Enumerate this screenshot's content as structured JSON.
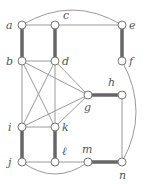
{
  "diagram": {
    "type": "graph",
    "nodes": [
      {
        "id": "a",
        "label": "a",
        "x": 22,
        "y": 25,
        "lx": 6,
        "ly": 29
      },
      {
        "id": "c",
        "label": "c",
        "x": 55,
        "y": 25,
        "lx": 63,
        "ly": 19
      },
      {
        "id": "e",
        "label": "e",
        "x": 122,
        "y": 25,
        "lx": 129,
        "ly": 29
      },
      {
        "id": "b",
        "label": "b",
        "x": 22,
        "y": 61,
        "lx": 6,
        "ly": 65
      },
      {
        "id": "d",
        "label": "d",
        "x": 55,
        "y": 61,
        "lx": 62,
        "ly": 65
      },
      {
        "id": "f",
        "label": "f",
        "x": 122,
        "y": 61,
        "lx": 129,
        "ly": 65
      },
      {
        "id": "g",
        "label": "g",
        "x": 88,
        "y": 95,
        "lx": 84,
        "ly": 111
      },
      {
        "id": "h",
        "label": "h",
        "x": 122,
        "y": 95,
        "lx": 108,
        "ly": 86
      },
      {
        "id": "i",
        "label": "i",
        "x": 22,
        "y": 127,
        "lx": 8,
        "ly": 131
      },
      {
        "id": "k",
        "label": "k",
        "x": 55,
        "y": 127,
        "lx": 62,
        "ly": 131
      },
      {
        "id": "j",
        "label": "j",
        "x": 22,
        "y": 162,
        "lx": 8,
        "ly": 166
      },
      {
        "id": "l",
        "label": "ℓ",
        "x": 55,
        "y": 162,
        "lx": 62,
        "ly": 155
      },
      {
        "id": "m",
        "label": "m",
        "x": 88,
        "y": 162,
        "lx": 82,
        "ly": 153
      },
      {
        "id": "n",
        "label": "n",
        "x": 122,
        "y": 162,
        "lx": 119,
        "ly": 179
      }
    ],
    "edges": [
      {
        "from": "a",
        "to": "c",
        "thick": false
      },
      {
        "from": "c",
        "to": "e",
        "thick": false
      },
      {
        "from": "a",
        "to": "b",
        "thick": true
      },
      {
        "from": "c",
        "to": "d",
        "thick": true
      },
      {
        "from": "e",
        "to": "f",
        "thick": true
      },
      {
        "from": "b",
        "to": "d",
        "thick": false
      },
      {
        "from": "b",
        "to": "i",
        "thick": false
      },
      {
        "from": "b",
        "to": "k",
        "thick": false
      },
      {
        "from": "b",
        "to": "g",
        "thick": false
      },
      {
        "from": "d",
        "to": "i",
        "thick": false
      },
      {
        "from": "d",
        "to": "k",
        "thick": false
      },
      {
        "from": "d",
        "to": "g",
        "thick": false
      },
      {
        "from": "i",
        "to": "g",
        "thick": false
      },
      {
        "from": "k",
        "to": "g",
        "thick": false
      },
      {
        "from": "i",
        "to": "k",
        "thick": false
      },
      {
        "from": "g",
        "to": "h",
        "thick": true
      },
      {
        "from": "h",
        "to": "n",
        "thick": false
      },
      {
        "from": "i",
        "to": "j",
        "thick": true
      },
      {
        "from": "k",
        "to": "l",
        "thick": true
      },
      {
        "from": "j",
        "to": "l",
        "thick": false
      },
      {
        "from": "l",
        "to": "m",
        "thick": false
      },
      {
        "from": "m",
        "to": "n",
        "thick": true
      }
    ],
    "curved_edges": [
      {
        "from": "a",
        "to": "e",
        "path": "M22 25 Q72 -5 122 25"
      },
      {
        "from": "f",
        "to": "n",
        "path": "M122 61 Q150 112 122 162"
      },
      {
        "from": "j",
        "to": "m",
        "path": "M22 162 Q55 186 88 162"
      }
    ],
    "colors": {
      "thin": "#999999",
      "thick": "#666666",
      "node_fill": "#ffffff",
      "node_stroke": "#777777"
    }
  }
}
